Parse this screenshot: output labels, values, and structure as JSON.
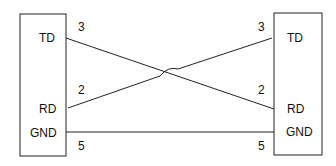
{
  "left_device": {
    "pins": {
      "td": "TD",
      "rd": "RD",
      "gnd": "GND"
    }
  },
  "right_device": {
    "pins": {
      "td": "TD",
      "rd": "RD",
      "gnd": "GND"
    }
  },
  "wire_numbers": {
    "left_td": "3",
    "left_rd": "2",
    "left_gnd": "5",
    "right_td": "3",
    "right_rd": "2",
    "right_gnd": "5"
  }
}
